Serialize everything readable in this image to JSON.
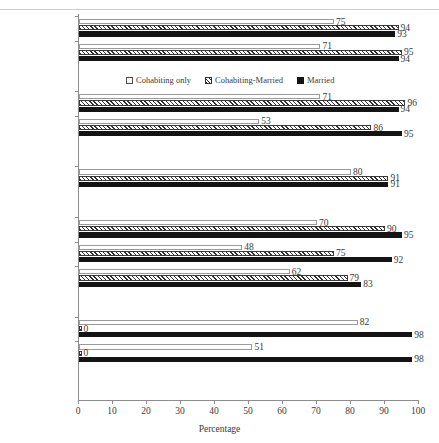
{
  "figure": {
    "cropped_title_fragment": "",
    "axis_title": "Percentage"
  },
  "legend": {
    "items": [
      {
        "label": "Cohabiting only",
        "swatch": "open-square-icon"
      },
      {
        "label": "Cohabiting-Married",
        "swatch": "hatched-square-icon"
      },
      {
        "label": "Married",
        "swatch": "filled-square-icon"
      }
    ]
  },
  "chart_data": {
    "type": "bar",
    "orientation": "horizontal",
    "title": "",
    "xlabel": "Percentage",
    "ylabel": "",
    "xlim": [
      0,
      100
    ],
    "xticks": [
      0,
      10,
      20,
      30,
      40,
      50,
      60,
      70,
      80,
      90,
      100
    ],
    "grid": false,
    "legend_position": "inside-upper-center",
    "categories": [
      "Sweden",
      "Norway",
      "Austria",
      "Switzerland",
      "West Germany",
      "France",
      "Great Britain",
      "United States",
      "Italy",
      "Spain"
    ],
    "group_breaks_after": [
      "Norway",
      "Switzerland",
      "West Germany",
      "United States"
    ],
    "series": [
      {
        "name": "Cohabiting only",
        "values": [
          75,
          71,
          71,
          53,
          80,
          70,
          48,
          62,
          82,
          51
        ]
      },
      {
        "name": "Cohabiting-Married",
        "values": [
          94,
          95,
          96,
          86,
          91,
          90,
          75,
          79,
          0,
          0
        ]
      },
      {
        "name": "Married",
        "values": [
          93,
          94,
          94,
          95,
          91,
          95,
          92,
          83,
          98,
          98
        ]
      }
    ]
  }
}
